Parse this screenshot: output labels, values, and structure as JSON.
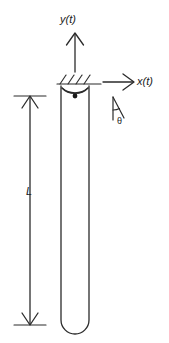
{
  "figure": {
    "labels": {
      "vertical_axis": "y(t)",
      "horizontal_axis": "x(t)",
      "length": "L",
      "angle": "θ"
    },
    "colors": {
      "stroke": "#2b2b2b",
      "background": "#ffffff",
      "text": "#1a1a1a"
    },
    "elements": {
      "support_hatching": "hatched-fixed-support",
      "pivot": "pin-joint-with-center-dot",
      "rod": "slender-rod-rounded-tip",
      "dimension": "length-dimension-L",
      "angle_marker": "angle-theta-from-vertical"
    },
    "geometry": {
      "rod_left_x": 61,
      "rod_right_x": 89,
      "rod_top_y": 86,
      "rod_bottom_y": 334,
      "rod_tip_radius": 14,
      "support_line_y": 84,
      "hatch_count": 4,
      "dimension_x": 30,
      "dimension_top_y": 96,
      "dimension_bottom_y": 325,
      "y_arrow_x": 75,
      "y_arrow_top_y": 33,
      "y_arrow_bottom_y": 72,
      "x_arrow_y": 82,
      "x_arrow_left_x": 103,
      "x_arrow_right_x": 134,
      "theta_apex_x": 113,
      "theta_apex_y": 97
    }
  }
}
